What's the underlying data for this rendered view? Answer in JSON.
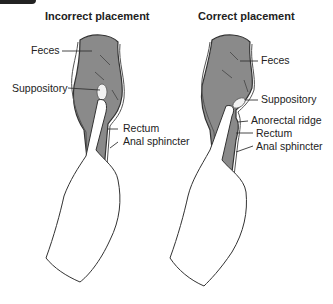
{
  "panels": [
    {
      "title": "Incorrect placement",
      "labels": {
        "feces": "Feces",
        "suppository": "Suppository",
        "rectum": "Rectum",
        "anal_sphincter": "Anal sphincter"
      }
    },
    {
      "title": "Correct placement",
      "labels": {
        "feces": "Feces",
        "suppository": "Suppository",
        "anorectal_ridge": "Anorectal ridge",
        "rectum": "Rectum",
        "anal_sphincter": "Anal sphincter"
      }
    }
  ],
  "colors": {
    "colon_fill": "#8a8a8a",
    "rectum_fill": "#9a9a9a",
    "outline": "#333333",
    "suppository": "#f2f2f2",
    "glove": "#ffffff"
  }
}
